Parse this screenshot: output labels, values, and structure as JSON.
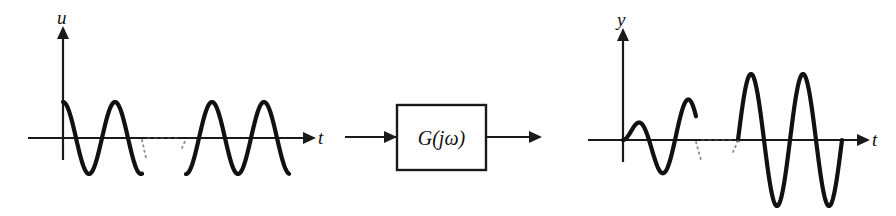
{
  "figure": {
    "background_color": "#ffffff",
    "stroke_color": "#111111",
    "axis_color": "#1a1a1a",
    "ellipsis_color": "#3a3a3a"
  },
  "input_plot": {
    "name": "input-signal-plot",
    "y_axis_label": "u",
    "x_axis_label": "t",
    "origin": {
      "x": 63,
      "y": 138
    },
    "y_axis_top": 26,
    "x_axis_start": 28,
    "x_axis_end": 308,
    "segment_gap": {
      "start": 142,
      "end": 186
    }
  },
  "output_plot": {
    "name": "output-signal-plot",
    "y_axis_label": "y",
    "x_axis_label": "t",
    "origin": {
      "x": 623,
      "y": 140
    },
    "y_axis_top": 28,
    "x_axis_start": 588,
    "x_axis_end": 862,
    "segment_gap": {
      "start": 696,
      "end": 738
    }
  },
  "block": {
    "name": "transfer-function-block",
    "label": "G(jω)",
    "rect": {
      "x": 397,
      "y": 105,
      "width": 89,
      "height": 65
    },
    "input_arrow": {
      "x1": 345,
      "x2": 397,
      "y": 137
    },
    "output_arrow": {
      "x1": 486,
      "x2": 534,
      "y": 137
    }
  },
  "chart_data": {
    "type": "line",
    "xlabel": "t",
    "ylabel": "u / y",
    "grid": false,
    "legend": null,
    "annotations": [
      {
        "text": "G(jω)",
        "role": "transfer-function-block-label"
      },
      {
        "text": "u",
        "role": "input-axis-label"
      },
      {
        "text": "y",
        "role": "output-axis-label"
      },
      {
        "text": "t",
        "role": "time-axis-label"
      }
    ],
    "series": [
      {
        "name": "u",
        "role": "input",
        "waveform": "cosine",
        "description": "Steady sinusoidal input of constant amplitude, starting at a positive peak at t=0",
        "amplitude": 1.0,
        "phase_deg": 0,
        "period_px": 52,
        "segments": [
          {
            "name": "input-segment-early",
            "t_start": 0.0,
            "t_end": 1.52,
            "x_start": 63,
            "x_end": 142,
            "amplitude_px": 36,
            "phase_deg": 0
          },
          {
            "name": "input-segment-late",
            "t_start": 2.37,
            "t_end": 4.35,
            "x_start": 186,
            "x_end": 289,
            "amplitude_px": 36,
            "phase_deg": 180
          }
        ]
      },
      {
        "name": "y",
        "role": "output",
        "waveform": "cosine",
        "description": "Output sinusoid: transient growth at first, settling to larger steady-state amplitude with phase lag",
        "steady_amplitude": 2.1,
        "phase_lag_deg": -70,
        "period_px": 52,
        "segments": [
          {
            "name": "output-segment-transient",
            "t_start": 0.0,
            "t_end": 1.4,
            "x_start": 623,
            "x_end": 696,
            "amplitude_start_px": 0,
            "amplitude_end_px": 46,
            "phase_deg": -90
          },
          {
            "name": "output-segment-steady",
            "t_start": 2.2,
            "t_end": 4.2,
            "x_start": 738,
            "x_end": 842,
            "amplitude_px": 66,
            "phase_deg": -90
          }
        ]
      }
    ],
    "ellipsis_breaks": [
      {
        "name": "input-ellipsis",
        "x_start": 148,
        "x_end": 180,
        "y": 138
      },
      {
        "name": "output-ellipsis",
        "x_start": 702,
        "x_end": 734,
        "y": 140
      }
    ]
  }
}
